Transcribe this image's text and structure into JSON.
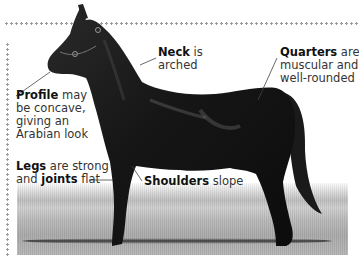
{
  "figure": {
    "colors": {
      "border_dots": "#9a9a9a",
      "text": "#333333",
      "text_bold": "#111111",
      "horse": "#141414",
      "ground": "#b8b8b8"
    }
  },
  "labels": {
    "neck": {
      "bold": "Neck",
      "rest_line1": " is",
      "line2": "arched"
    },
    "quarters": {
      "bold": "Quarters",
      "rest_line1": " are",
      "line2": "muscular and",
      "line3": "well-rounded"
    },
    "profile": {
      "bold": "Profile",
      "rest_line1": " may",
      "line2": "be concave,",
      "line3": "giving an",
      "line4": "Arabian look"
    },
    "legs": {
      "bold": "Legs",
      "rest_line1": " are strong",
      "line2_pre": "and ",
      "line2_bold": "joints",
      "line2_post": " flat"
    },
    "shoulders": {
      "bold": "Shoulders",
      "rest_line1": " slope"
    }
  }
}
